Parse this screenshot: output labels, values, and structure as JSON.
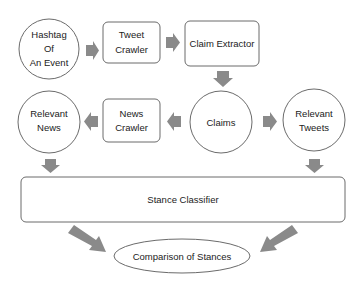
{
  "diagram": {
    "nodes": {
      "hashtag": {
        "lines": [
          "Hashtag",
          "Of",
          "An Event"
        ],
        "shape": "circle"
      },
      "tweet_crawler": {
        "lines": [
          "Tweet",
          "Crawler"
        ],
        "shape": "rounded-rect"
      },
      "claim_extractor": {
        "lines": [
          "Claim Extractor"
        ],
        "shape": "rounded-rect"
      },
      "claims": {
        "lines": [
          "Claims"
        ],
        "shape": "circle"
      },
      "relevant_tweets": {
        "lines": [
          "Relevant",
          "Tweets"
        ],
        "shape": "circle"
      },
      "news_crawler": {
        "lines": [
          "News",
          "Crawler"
        ],
        "shape": "rounded-rect"
      },
      "relevant_news": {
        "lines": [
          "Relevant",
          "News"
        ],
        "shape": "circle"
      },
      "stance_classifier": {
        "lines": [
          "Stance Classifier"
        ],
        "shape": "rounded-rect"
      },
      "comparison": {
        "lines": [
          "Comparison of Stances"
        ],
        "shape": "ellipse"
      }
    },
    "edges": [
      {
        "from": "hashtag",
        "to": "tweet_crawler"
      },
      {
        "from": "tweet_crawler",
        "to": "claim_extractor"
      },
      {
        "from": "claim_extractor",
        "to": "claims"
      },
      {
        "from": "claims",
        "to": "news_crawler"
      },
      {
        "from": "news_crawler",
        "to": "relevant_news"
      },
      {
        "from": "claims",
        "to": "relevant_tweets"
      },
      {
        "from": "relevant_news",
        "to": "stance_classifier"
      },
      {
        "from": "relevant_tweets",
        "to": "stance_classifier"
      },
      {
        "from": "stance_classifier",
        "to": "comparison"
      }
    ],
    "colors": {
      "arrow": "#8a8a8a",
      "stroke": "#6b6b6b",
      "text": "#222222"
    }
  }
}
